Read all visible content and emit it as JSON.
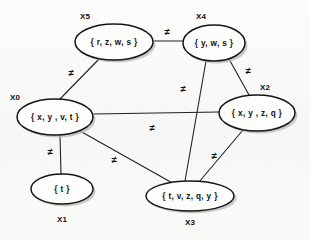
{
  "diagram": {
    "background_color": "#fbfbfa",
    "node_fill": "#fdfdfc",
    "node_stroke": "#161616",
    "edge_color": "#222222",
    "text_color": "#111111",
    "constraint_symbol": "≠",
    "nodes": [
      {
        "id": "X5",
        "tag": "X5",
        "domain": "{ r, z, w, s }",
        "cx": 114,
        "cy": 42,
        "rx": 39,
        "ry": 18,
        "tag_x": 85,
        "tag_y": 17
      },
      {
        "id": "X4",
        "tag": "X4",
        "domain": "{ y, w, s }",
        "cx": 214,
        "cy": 43,
        "rx": 31,
        "ry": 18,
        "tag_x": 201,
        "tag_y": 17
      },
      {
        "id": "X0",
        "tag": "X0",
        "domain": "{ x, y , v, t }",
        "cx": 55,
        "cy": 117,
        "rx": 38,
        "ry": 18,
        "tag_x": 15,
        "tag_y": 98
      },
      {
        "id": "X2",
        "tag": "X2",
        "domain": "{ x, y , z, q }",
        "cx": 257,
        "cy": 113,
        "rx": 38,
        "ry": 18,
        "tag_x": 265,
        "tag_y": 88
      },
      {
        "id": "X1",
        "tag": "X1",
        "domain": "{ t }",
        "cx": 62,
        "cy": 189,
        "rx": 31,
        "ry": 15,
        "tag_x": 62,
        "tag_y": 220
      },
      {
        "id": "X3",
        "tag": "X3",
        "domain": "{ t, v, z, q, y }",
        "cx": 190,
        "cy": 196,
        "rx": 44,
        "ry": 15,
        "tag_x": 190,
        "tag_y": 223
      }
    ],
    "edges": [
      {
        "id": "X5-X4",
        "from": "X5",
        "to": "X4",
        "x1": 153,
        "y1": 41,
        "x2": 183,
        "y2": 41,
        "label": "≠",
        "label_x": 167,
        "label_y": 32
      },
      {
        "id": "X5-X0",
        "from": "X5",
        "to": "X0",
        "x1": 100,
        "y1": 58,
        "x2": 60,
        "y2": 99,
        "label": "≠",
        "label_x": 71,
        "label_y": 73
      },
      {
        "id": "X4-X2",
        "from": "X4",
        "to": "X2",
        "x1": 229,
        "y1": 59,
        "x2": 249,
        "y2": 95,
        "label": "≠",
        "label_x": 248,
        "label_y": 71
      },
      {
        "id": "X4-X3",
        "from": "X4",
        "to": "X3",
        "x1": 206,
        "y1": 61,
        "x2": 185,
        "y2": 181,
        "label": "≠",
        "label_x": 183,
        "label_y": 89
      },
      {
        "id": "X0-X2",
        "from": "X0",
        "to": "X2",
        "x1": 93,
        "y1": 114,
        "x2": 219,
        "y2": 112,
        "label": "≠",
        "label_x": 152,
        "label_y": 128
      },
      {
        "id": "X0-X1",
        "from": "X0",
        "to": "X1",
        "x1": 60,
        "y1": 135,
        "x2": 61,
        "y2": 174,
        "label": "≠",
        "label_x": 50,
        "label_y": 152
      },
      {
        "id": "X0-X3",
        "from": "X0",
        "to": "X3",
        "x1": 80,
        "y1": 131,
        "x2": 176,
        "y2": 185,
        "label": "≠",
        "label_x": 114,
        "label_y": 160
      },
      {
        "id": "X2-X3",
        "from": "X2",
        "to": "X3",
        "x1": 243,
        "y1": 130,
        "x2": 199,
        "y2": 182,
        "label": "≠",
        "label_x": 214,
        "label_y": 156
      }
    ]
  }
}
